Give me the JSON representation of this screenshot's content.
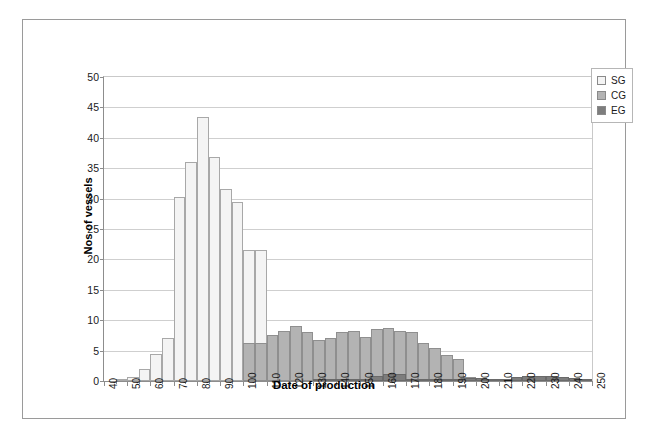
{
  "chart_data": {
    "type": "bar",
    "title": "",
    "subtitle": "",
    "xlabel": "Date of production",
    "ylabel": "Nos of vessels",
    "xlim": [
      40,
      250
    ],
    "ylim": [
      0,
      50
    ],
    "ytick_step": 5,
    "xtick_major_step": 10,
    "xtick_minor_step": 5,
    "bin_width": 5,
    "grid": "horizontal",
    "stacking": "overlaid",
    "legend_position": "top-right",
    "yticks": [
      "0",
      "5",
      "10",
      "15",
      "20",
      "25",
      "30",
      "35",
      "40",
      "45",
      "50"
    ],
    "xticks": [
      "40",
      "50",
      "60",
      "70",
      "80",
      "90",
      "100",
      "110",
      "120",
      "130",
      "140",
      "150",
      "160",
      "170",
      "180",
      "190",
      "200",
      "210",
      "220",
      "230",
      "240",
      "250"
    ],
    "bin_starts": [
      40,
      45,
      50,
      55,
      60,
      65,
      70,
      75,
      80,
      85,
      90,
      95,
      100,
      105,
      110,
      115,
      120,
      125,
      130,
      135,
      140,
      145,
      150,
      155,
      160,
      165,
      170,
      175,
      180,
      185,
      190,
      195,
      200,
      205,
      210,
      215,
      220,
      225,
      230,
      235,
      240,
      245
    ],
    "series": [
      {
        "name": "SG",
        "color": "#f4f4f4",
        "edge_color": "#a8a8a8",
        "values": [
          0,
          0.3,
          0.7,
          2.0,
          4.4,
          7.0,
          30.3,
          36.0,
          43.5,
          36.8,
          31.6,
          29.5,
          21.5,
          21.5,
          0,
          0,
          0,
          0,
          0,
          0,
          0,
          0,
          0,
          0,
          0,
          0,
          0,
          0,
          0,
          0,
          0,
          0,
          0,
          0,
          0,
          0,
          0,
          0,
          0,
          0,
          0,
          0
        ]
      },
      {
        "name": "CG",
        "color": "#b3b3b3",
        "edge_color": "#8f8f8f",
        "values": [
          0,
          0,
          0,
          0,
          0,
          0,
          0,
          0,
          0,
          0,
          0,
          0,
          6.3,
          6.3,
          7.6,
          8.3,
          9.0,
          8.0,
          6.7,
          7.0,
          8.0,
          8.2,
          7.3,
          8.6,
          8.8,
          8.3,
          8.0,
          6.2,
          5.5,
          4.3,
          3.6,
          0.6,
          0.5,
          0.4,
          0.4,
          0.7,
          0.8,
          0.8,
          0.8,
          0.6,
          0.5,
          0.2
        ]
      },
      {
        "name": "EG",
        "color": "#7d7d7d",
        "edge_color": "#6a6a6a",
        "values": [
          0,
          0,
          0,
          0,
          0,
          0,
          0,
          0,
          0,
          0,
          0,
          0,
          0,
          0,
          0,
          0,
          0,
          0,
          0.3,
          0.3,
          0.3,
          0.3,
          0.3,
          0.9,
          1.1,
          1.1,
          0.4,
          0.3,
          0.3,
          0.3,
          0.3,
          0.5,
          0.5,
          0.4,
          0.4,
          0.7,
          0.8,
          0.8,
          0.8,
          0.6,
          0.5,
          0.2
        ]
      }
    ],
    "legend": [
      {
        "label": "SG",
        "color": "#f4f4f4"
      },
      {
        "label": "CG",
        "color": "#b3b3b3"
      },
      {
        "label": "EG",
        "color": "#7d7d7d"
      }
    ]
  }
}
